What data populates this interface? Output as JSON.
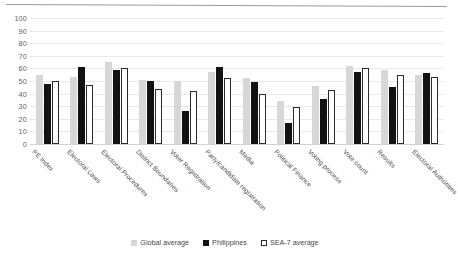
{
  "chart_data": {
    "type": "bar",
    "title": "",
    "xlabel": "",
    "ylabel": "",
    "ylim": [
      0,
      100
    ],
    "yticks": [
      0,
      10,
      20,
      30,
      40,
      50,
      60,
      70,
      80,
      90,
      100
    ],
    "grid": true,
    "legend_position": "bottom",
    "categories": [
      "PE Index",
      "Electoral Laws",
      "Electoral Procedures",
      "District Boundaries",
      "Voter Registration",
      "Party/candidate registration",
      "Media",
      "Political Finance",
      "Voting process",
      "Vote count",
      "Results",
      "Electoral Authorities"
    ],
    "series": [
      {
        "name": "Global average",
        "color": "#d7d7d7",
        "values": [
          55,
          53,
          65,
          51,
          50,
          57,
          52,
          34,
          46,
          62,
          59,
          55
        ]
      },
      {
        "name": "Philippines",
        "color": "#121212",
        "values": [
          48,
          61,
          59,
          50,
          26,
          61,
          49,
          17,
          36,
          57,
          45,
          56
        ]
      },
      {
        "name": "SEA-7 average",
        "color": "#ffffff",
        "values": [
          50,
          47,
          60,
          44,
          42,
          52,
          40,
          29,
          43,
          60,
          55,
          53
        ]
      }
    ]
  },
  "legend": {
    "items": [
      {
        "label": "Global average"
      },
      {
        "label": "Philippines"
      },
      {
        "label": "SEA-7 average"
      }
    ]
  }
}
